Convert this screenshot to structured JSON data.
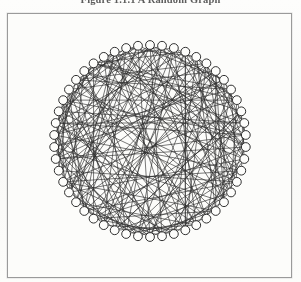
{
  "figure": {
    "caption": "Figure 1.1.1   A Random Graph",
    "caption_label": "Figure 1.1.1",
    "caption_title": "A Random Graph"
  },
  "border": {
    "x": 7,
    "y": 13,
    "width": 285,
    "height": 265,
    "color": "#9a9a9a"
  },
  "page": {
    "background_color": "#fbfbf9",
    "width": 301,
    "height": 282
  },
  "chart_data": {
    "type": "diagram",
    "diagram_type": "circular-layout-random-graph",
    "title": "A Random Graph",
    "node_count": 50,
    "node_radius": 4.4,
    "node_fill": "#fdfdfb",
    "node_stroke": "#262626",
    "edge_color": "#2b2b2b",
    "edge_width": 0.72,
    "layout": {
      "center_x": 150,
      "center_y": 141,
      "ring_radius": 96,
      "start_angle_deg": -90
    },
    "edges": [
      [
        0,
        13
      ],
      [
        0,
        24
      ],
      [
        0,
        31
      ],
      [
        0,
        40
      ],
      [
        1,
        18
      ],
      [
        1,
        27
      ],
      [
        1,
        36
      ],
      [
        1,
        44
      ],
      [
        2,
        9
      ],
      [
        2,
        21
      ],
      [
        2,
        33
      ],
      [
        2,
        46
      ],
      [
        3,
        16
      ],
      [
        3,
        28
      ],
      [
        3,
        39
      ],
      [
        4,
        11
      ],
      [
        4,
        23
      ],
      [
        4,
        35
      ],
      [
        4,
        48
      ],
      [
        5,
        14
      ],
      [
        5,
        26
      ],
      [
        5,
        38
      ],
      [
        6,
        19
      ],
      [
        6,
        30
      ],
      [
        6,
        42
      ],
      [
        7,
        12
      ],
      [
        7,
        25
      ],
      [
        7,
        37
      ],
      [
        7,
        49
      ],
      [
        8,
        20
      ],
      [
        8,
        32
      ],
      [
        8,
        43
      ],
      [
        9,
        17
      ],
      [
        9,
        29
      ],
      [
        9,
        41
      ],
      [
        10,
        22
      ],
      [
        10,
        34
      ],
      [
        10,
        45
      ],
      [
        11,
        15
      ],
      [
        11,
        27
      ],
      [
        11,
        39
      ],
      [
        12,
        24
      ],
      [
        12,
        36
      ],
      [
        12,
        47
      ],
      [
        13,
        19
      ],
      [
        13,
        31
      ],
      [
        13,
        44
      ],
      [
        14,
        21
      ],
      [
        14,
        33
      ],
      [
        14,
        46
      ],
      [
        15,
        26
      ],
      [
        15,
        38
      ],
      [
        15,
        49
      ],
      [
        16,
        23
      ],
      [
        16,
        35
      ],
      [
        16,
        41
      ],
      [
        17,
        28
      ],
      [
        17,
        40
      ],
      [
        18,
        25
      ],
      [
        18,
        37
      ],
      [
        18,
        48
      ],
      [
        19,
        30
      ],
      [
        19,
        43
      ],
      [
        20,
        27
      ],
      [
        20,
        39
      ],
      [
        21,
        32
      ],
      [
        21,
        45
      ],
      [
        22,
        29
      ],
      [
        22,
        42
      ],
      [
        23,
        34
      ],
      [
        23,
        47
      ],
      [
        24,
        31
      ],
      [
        24,
        44
      ],
      [
        25,
        36
      ],
      [
        25,
        49
      ],
      [
        26,
        33
      ],
      [
        26,
        41
      ],
      [
        27,
        38
      ],
      [
        27,
        46
      ],
      [
        28,
        35
      ],
      [
        28,
        43
      ],
      [
        29,
        40
      ],
      [
        29,
        48
      ],
      [
        30,
        37
      ],
      [
        30,
        45
      ],
      [
        31,
        42
      ],
      [
        31,
        47
      ],
      [
        32,
        39
      ],
      [
        32,
        49
      ],
      [
        33,
        44
      ],
      [
        34,
        41
      ],
      [
        34,
        46
      ],
      [
        35,
        42
      ],
      [
        36,
        43
      ],
      [
        36,
        48
      ],
      [
        37,
        44
      ],
      [
        38,
        45
      ],
      [
        39,
        47
      ],
      [
        40,
        46
      ],
      [
        41,
        49
      ],
      [
        42,
        48
      ],
      [
        43,
        49
      ],
      [
        0,
        7
      ],
      [
        1,
        9
      ],
      [
        2,
        5
      ],
      [
        3,
        11
      ],
      [
        4,
        18
      ],
      [
        5,
        22
      ],
      [
        6,
        13
      ],
      [
        8,
        16
      ],
      [
        10,
        14
      ],
      [
        12,
        20
      ],
      [
        17,
        24
      ],
      [
        19,
        26
      ],
      [
        21,
        28
      ],
      [
        23,
        30
      ],
      [
        25,
        32
      ],
      [
        29,
        34
      ],
      [
        33,
        38
      ],
      [
        35,
        40
      ],
      [
        37,
        41
      ],
      [
        39,
        45
      ],
      [
        44,
        47
      ],
      [
        46,
        49
      ],
      [
        0,
        20
      ],
      [
        1,
        33
      ],
      [
        2,
        38
      ],
      [
        3,
        45
      ],
      [
        4,
        8
      ],
      [
        5,
        17
      ],
      [
        6,
        25
      ],
      [
        7,
        31
      ],
      [
        8,
        45
      ],
      [
        9,
        12
      ],
      [
        10,
        28
      ],
      [
        11,
        44
      ],
      [
        13,
        36
      ],
      [
        14,
        2
      ],
      [
        16,
        47
      ],
      [
        18,
        6
      ],
      [
        20,
        48
      ],
      [
        22,
        3
      ],
      [
        24,
        41
      ],
      [
        26,
        10
      ],
      [
        28,
        1
      ],
      [
        30,
        15
      ],
      [
        32,
        5
      ],
      [
        34,
        19
      ],
      [
        36,
        7
      ],
      [
        38,
        23
      ],
      [
        40,
        11
      ],
      [
        42,
        27
      ],
      [
        46,
        21
      ],
      [
        0,
        35
      ],
      [
        3,
        22
      ],
      [
        5,
        43
      ],
      [
        7,
        18
      ],
      [
        9,
        37
      ],
      [
        11,
        30
      ],
      [
        13,
        48
      ],
      [
        15,
        34
      ],
      [
        17,
        46
      ],
      [
        19,
        4
      ],
      [
        21,
        39
      ],
      [
        23,
        8
      ],
      [
        25,
        44
      ],
      [
        27,
        14
      ],
      [
        29,
        2
      ],
      [
        31,
        16
      ],
      [
        33,
        49
      ],
      [
        35,
        6
      ],
      [
        37,
        26
      ],
      [
        39,
        12
      ],
      [
        41,
        31
      ],
      [
        43,
        20
      ],
      [
        45,
        9
      ],
      [
        47,
        32
      ],
      [
        49,
        17
      ],
      [
        6,
        34
      ],
      [
        12,
        41
      ],
      [
        2,
        26
      ],
      [
        4,
        29
      ],
      [
        8,
        38
      ],
      [
        14,
        42
      ],
      [
        16,
        1
      ],
      [
        22,
        47
      ],
      [
        28,
        10
      ],
      [
        30,
        3
      ],
      [
        40,
        24
      ],
      [
        44,
        15
      ],
      [
        48,
        33
      ],
      [
        18,
        43
      ],
      [
        36,
        0
      ],
      [
        46,
        13
      ]
    ]
  }
}
